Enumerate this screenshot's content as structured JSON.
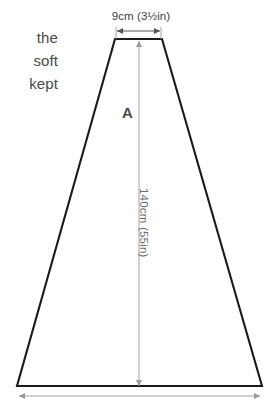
{
  "figure": {
    "piece_label": "A",
    "top_width_label": "9cm (3½in)",
    "height_label": "140cm (55in)"
  },
  "side_text": {
    "lines": [
      "the",
      "soft",
      "kept"
    ]
  },
  "colors": {
    "outline": "#1a1a1a",
    "dimension_line": "#9a9a9a",
    "dimension_text": "#3d3d3d",
    "body_text": "#4a4a4a",
    "background": "#ffffff"
  },
  "geometry": {
    "top_left_x": 115,
    "top_right_x": 162,
    "top_y": 39,
    "bottom_left_x": 17,
    "bottom_right_x": 262,
    "bottom_y": 386,
    "center_x": 139
  }
}
